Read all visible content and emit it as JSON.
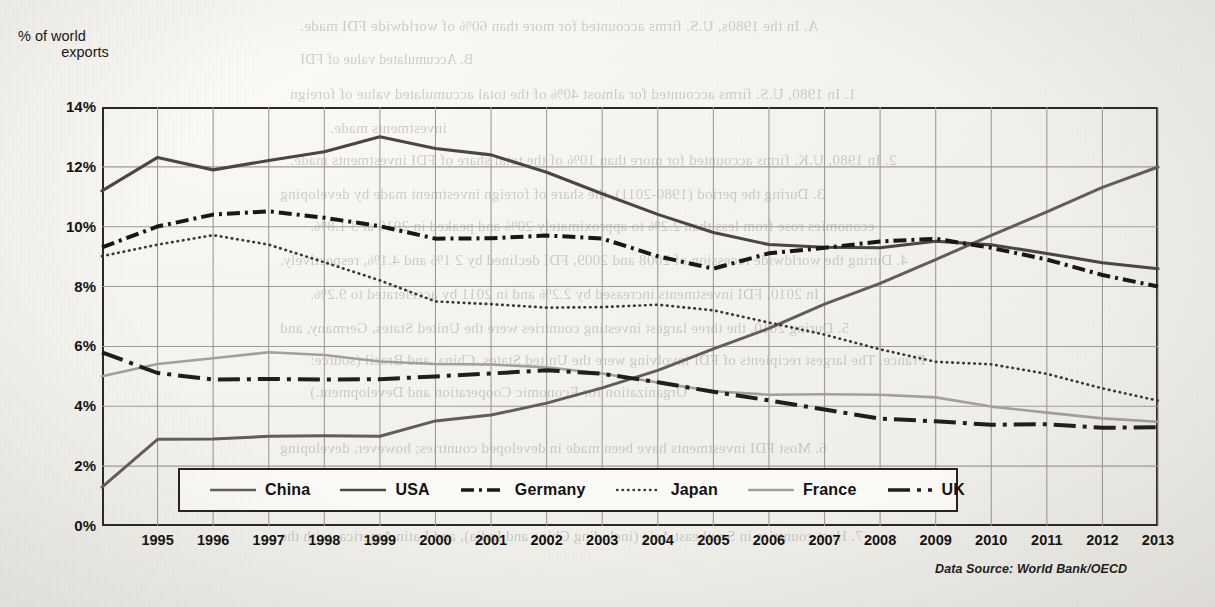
{
  "axis": {
    "y_title_line1": "% of world",
    "y_title_line2": "exports",
    "y_ticks": [
      "14%",
      "12%",
      "10%",
      "8%",
      "6%",
      "4%",
      "2%",
      "0%"
    ],
    "x_ticks": [
      "1995",
      "1996",
      "1997",
      "1998",
      "1999",
      "2000",
      "2001",
      "2002",
      "2003",
      "2004",
      "2005",
      "2006",
      "2007",
      "2008",
      "2009",
      "2010",
      "2011",
      "2012",
      "2013"
    ]
  },
  "legend": {
    "items": [
      {
        "label": "China",
        "style": "solid-gray"
      },
      {
        "label": "USA",
        "style": "solid-dark"
      },
      {
        "label": "Germany",
        "style": "dash-dot-heavy"
      },
      {
        "label": "Japan",
        "style": "dotted"
      },
      {
        "label": "France",
        "style": "solid-light"
      },
      {
        "label": "UK",
        "style": "dash-dot-long"
      }
    ]
  },
  "source": {
    "text": "Data Source: World Bank/OECD"
  },
  "colors": {
    "ink": "#2a2724",
    "grid": "#9b9792",
    "paper": "#f3f2ee",
    "light_series": "#9a9691"
  },
  "bleed_text": [
    {
      "x": 300,
      "y": 18,
      "size": 15,
      "text": "A.   In the 1980s, U.S. firms accounted for more than 60% of worldwide FDI made."
    },
    {
      "x": 300,
      "y": 52,
      "size": 14,
      "text": "B.   Accumulated value of FDI"
    },
    {
      "x": 290,
      "y": 86,
      "size": 15,
      "text": "1.   In 1980, U.S. firms accounted for almost 40% of the total accumulated value of foreign"
    },
    {
      "x": 330,
      "y": 120,
      "size": 15,
      "text": "investments made."
    },
    {
      "x": 290,
      "y": 152,
      "size": 15,
      "text": "2.   In 1980, U.K. firms accounted for more than 10% of the total share of FDI investments made."
    },
    {
      "x": 280,
      "y": 186,
      "size": 15,
      "text": "3.   During the period (1980-2011), the share of foreign investment made by developing"
    },
    {
      "x": 310,
      "y": 218,
      "size": 15,
      "text": "economies rose from less than 2.2% to approximately 20% and peaked in 2010 at 3 1.8%."
    },
    {
      "x": 280,
      "y": 252,
      "size": 15,
      "text": "4.   During the worldwide recession of 2008 and 2009, FDI declined by 2 1% and 4.1%, respectively."
    },
    {
      "x": 310,
      "y": 286,
      "size": 15,
      "text": "In 2010, FDI investments increased by 2.2% and in 2011 by accelerated to 9.2%."
    },
    {
      "x": 280,
      "y": 320,
      "size": 15,
      "text": "5.   During 2010, the three largest investing countries were the United States, Germany, and"
    },
    {
      "x": 310,
      "y": 352,
      "size": 15,
      "text": "France. The largest recipients of FDI involving were the United States, China, and Brazil (source:"
    },
    {
      "x": 310,
      "y": 384,
      "size": 15,
      "text": "Organization for Economic Cooperation and Development.)"
    },
    {
      "x": 280,
      "y": 440,
      "size": 15,
      "text": "6.   Most FDI investments have been made in developed countries; however, developing"
    },
    {
      "x": 310,
      "y": 472,
      "size": 15,
      "text": "countries have been the destination for an increasing share of FDI."
    },
    {
      "x": 280,
      "y": 528,
      "size": 15,
      "text": "7.   Host countries in Southeast Asia (including China and India), and Latin America, with the"
    }
  ],
  "chart_data": {
    "type": "line",
    "title": "",
    "xlabel": "",
    "ylabel": "% of world exports",
    "ylim": [
      0,
      14
    ],
    "xlim": [
      1994,
      2013
    ],
    "grid": true,
    "legend_position": "bottom-inside",
    "x": [
      1994,
      1995,
      1996,
      1997,
      1998,
      1999,
      2000,
      2001,
      2002,
      2003,
      2004,
      2005,
      2006,
      2007,
      2008,
      2009,
      2010,
      2011,
      2012,
      2013
    ],
    "series": [
      {
        "name": "China",
        "style": "solid-gray",
        "values": [
          1.3,
          2.9,
          2.9,
          3.0,
          3.0,
          3.0,
          3.5,
          3.7,
          4.1,
          4.6,
          5.2,
          5.9,
          6.6,
          7.4,
          8.1,
          8.9,
          9.7,
          10.5,
          11.3,
          12.0
        ]
      },
      {
        "name": "USA",
        "style": "solid-dark",
        "values": [
          11.2,
          12.3,
          11.9,
          12.2,
          12.5,
          13.0,
          12.6,
          12.4,
          11.8,
          11.1,
          10.4,
          9.8,
          9.4,
          9.3,
          9.3,
          9.5,
          9.4,
          9.1,
          8.8,
          8.6
        ]
      },
      {
        "name": "Germany",
        "style": "dash-dot-heavy",
        "values": [
          9.3,
          10.0,
          10.4,
          10.5,
          10.3,
          10.0,
          9.6,
          9.6,
          9.7,
          9.6,
          9.0,
          8.6,
          9.1,
          9.3,
          9.5,
          9.6,
          9.3,
          8.9,
          8.4,
          8.0
        ]
      },
      {
        "name": "Japan",
        "style": "dotted",
        "values": [
          9.0,
          9.4,
          9.7,
          9.4,
          8.8,
          8.2,
          7.5,
          7.4,
          7.3,
          7.3,
          7.4,
          7.2,
          6.8,
          6.4,
          5.9,
          5.5,
          5.4,
          5.1,
          4.6,
          4.2
        ]
      },
      {
        "name": "France",
        "style": "solid-light",
        "values": [
          5.0,
          5.4,
          5.6,
          5.8,
          5.7,
          5.5,
          5.4,
          5.4,
          5.3,
          5.1,
          4.8,
          4.5,
          4.4,
          4.4,
          4.4,
          4.3,
          4.0,
          3.8,
          3.6,
          3.5
        ]
      },
      {
        "name": "UK",
        "style": "dash-dot-long",
        "values": [
          5.8,
          5.1,
          4.9,
          4.9,
          4.9,
          4.9,
          5.0,
          5.1,
          5.2,
          5.1,
          4.8,
          4.5,
          4.2,
          3.9,
          3.6,
          3.5,
          3.4,
          3.4,
          3.3,
          3.3
        ]
      }
    ]
  }
}
